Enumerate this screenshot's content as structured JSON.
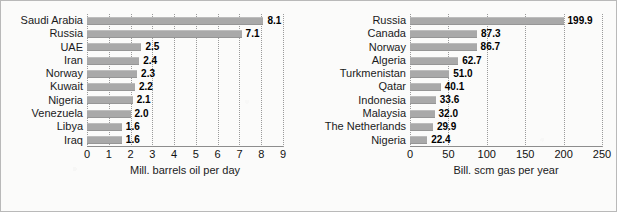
{
  "chart_data": [
    {
      "id": "oil",
      "type": "bar",
      "orientation": "horizontal",
      "title": "",
      "xlabel": "Mill. barrels oil per day",
      "ylabel": "",
      "xlim": [
        0,
        9
      ],
      "ticks": [
        0,
        1,
        2,
        3,
        4,
        5,
        6,
        7,
        8,
        9
      ],
      "tick_labels": [
        "0",
        "1",
        "2",
        "3",
        "4",
        "5",
        "6",
        "7",
        "8",
        "9"
      ],
      "grid": "vertical-dotted",
      "legend": "none",
      "bar_color": "#a9a9a9",
      "categories": [
        "Saudi Arabia",
        "Russia",
        "UAE",
        "Iran",
        "Norway",
        "Kuwait",
        "Nigeria",
        "Venezuela",
        "Libya",
        "Iraq"
      ],
      "values": [
        8.1,
        7.1,
        2.5,
        2.4,
        2.3,
        2.2,
        2.1,
        2.0,
        1.6,
        1.6
      ],
      "value_labels": [
        "8.1",
        "7.1",
        "2.5",
        "2.4",
        "2.3",
        "2.2",
        "2.1",
        "2.0",
        "1.6",
        "1.6"
      ]
    },
    {
      "id": "gas",
      "type": "bar",
      "orientation": "horizontal",
      "title": "",
      "xlabel": "Bill. scm gas per year",
      "ylabel": "",
      "xlim": [
        0,
        250
      ],
      "ticks": [
        0,
        50,
        100,
        150,
        200,
        250
      ],
      "tick_labels": [
        "0",
        "50",
        "100",
        "150",
        "200",
        "250"
      ],
      "grid": "vertical-dotted",
      "legend": "none",
      "bar_color": "#a9a9a9",
      "categories": [
        "Russia",
        "Canada",
        "Norway",
        "Algeria",
        "Turkmenistan",
        "Qatar",
        "Indonesia",
        "Malaysia",
        "The Netherlands",
        "Nigeria"
      ],
      "values": [
        199.9,
        87.3,
        86.7,
        62.7,
        51.0,
        40.1,
        33.6,
        32.0,
        29.9,
        22.4
      ],
      "value_labels": [
        "199.9",
        "87.3",
        "86.7",
        "62.7",
        "51.0",
        "40.1",
        "33.6",
        "32.0",
        "29.9",
        "22.4"
      ]
    }
  ],
  "figure": {
    "panels": [
      "oil",
      "gas"
    ],
    "background_color": "#fbfbfa",
    "border_color": "#b9b9b9",
    "text_color": "#1a1a1a"
  }
}
